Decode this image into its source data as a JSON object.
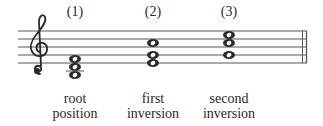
{
  "figure": {
    "chords": [
      {
        "number": "(1)",
        "caption_line1": "root",
        "caption_line2": "position",
        "x": 75
      },
      {
        "number": "(2)",
        "caption_line1": "first",
        "caption_line2": "inversion",
        "x": 153
      },
      {
        "number": "(3)",
        "caption_line1": "second",
        "caption_line2": "inversion",
        "x": 229
      }
    ],
    "clef": "treble-clef"
  }
}
